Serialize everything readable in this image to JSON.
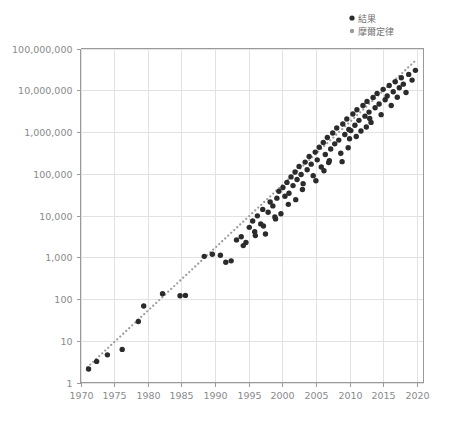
{
  "chart_data": {
    "type": "scatter",
    "title": "",
    "subtitle": "",
    "xlabel": "",
    "ylabel": "",
    "xlim": [
      1970,
      2021
    ],
    "ylim": [
      1,
      100000000
    ],
    "yscale": "log",
    "xscale": "linear",
    "grid": true,
    "legend_position": "top-right",
    "x_ticks": [
      1970,
      1975,
      1980,
      1985,
      1990,
      1995,
      2000,
      2005,
      2010,
      2015,
      2020
    ],
    "x_tick_labels": [
      "1970",
      "1975",
      "1980",
      "1985",
      "1990",
      "1995",
      "2000",
      "2005",
      "2010",
      "2015",
      "2020"
    ],
    "y_ticks": [
      1,
      10,
      100,
      1000,
      10000,
      100000,
      1000000,
      10000000,
      100000000
    ],
    "y_tick_labels": [
      "1",
      "10",
      "100",
      "1,000",
      "10,000",
      "100,000",
      "1,000,000",
      "10,000,000",
      "100,000,000"
    ],
    "colors": {
      "results": "#2b2b2b",
      "moore": "#9b9b9b",
      "grid": "#e2e2e2",
      "axis": "#9a9a9a",
      "tick_text": "#8a8a8a",
      "legend_text": "#6f6f6f",
      "background": "#ffffff"
    },
    "series": [
      {
        "name": "結果",
        "marker": "circle",
        "color": "#2b2b2b",
        "points": [
          [
            1971.2,
            2.1
          ],
          [
            1972.4,
            3.2
          ],
          [
            1974.0,
            4.6
          ],
          [
            1976.2,
            6.2
          ],
          [
            1978.6,
            29.0
          ],
          [
            1979.4,
            68.0
          ],
          [
            1982.2,
            134.0
          ],
          [
            1984.8,
            120.0
          ],
          [
            1985.6,
            122.0
          ],
          [
            1988.4,
            1050.0
          ],
          [
            1989.6,
            1180.0
          ],
          [
            1990.8,
            1120.0
          ],
          [
            1991.6,
            760.0
          ],
          [
            1992.4,
            820.0
          ],
          [
            1993.2,
            2600.0
          ],
          [
            1993.9,
            3100.0
          ],
          [
            1994.6,
            2250.0
          ],
          [
            1995.1,
            5200.0
          ],
          [
            1995.6,
            7400.0
          ],
          [
            1995.9,
            4100.0
          ],
          [
            1996.3,
            9800.0
          ],
          [
            1996.8,
            6300.0
          ],
          [
            1997.1,
            14000.0
          ],
          [
            1997.5,
            3600.0
          ],
          [
            1997.9,
            12000.0
          ],
          [
            1998.2,
            21000.0
          ],
          [
            1998.6,
            17000.0
          ],
          [
            1998.9,
            9200.0
          ],
          [
            1999.2,
            26000.0
          ],
          [
            1999.5,
            38000.0
          ],
          [
            1999.8,
            11000.0
          ],
          [
            2000.1,
            47000.0
          ],
          [
            2000.4,
            29000.0
          ],
          [
            2000.7,
            62000.0
          ],
          [
            2001.0,
            34000.0
          ],
          [
            2001.3,
            84000.0
          ],
          [
            2001.6,
            52000.0
          ],
          [
            2001.9,
            110000.0
          ],
          [
            2002.2,
            73000.0
          ],
          [
            2002.5,
            150000.0
          ],
          [
            2002.8,
            96000.0
          ],
          [
            2003.1,
            58000.0
          ],
          [
            2003.4,
            190000.0
          ],
          [
            2003.7,
            125000.0
          ],
          [
            2004.0,
            260000.0
          ],
          [
            2004.3,
            170000.0
          ],
          [
            2004.6,
            90000.0
          ],
          [
            2004.9,
            330000.0
          ],
          [
            2005.2,
            215000.0
          ],
          [
            2005.5,
            430000.0
          ],
          [
            2005.8,
            145000.0
          ],
          [
            2006.1,
            560000.0
          ],
          [
            2006.4,
            290000.0
          ],
          [
            2006.7,
            740000.0
          ],
          [
            2006.9,
            185000.0
          ],
          [
            2007.2,
            390000.0
          ],
          [
            2007.5,
            950000.0
          ],
          [
            2007.8,
            520000.0
          ],
          [
            2008.1,
            1250000.0
          ],
          [
            2008.4,
            640000.0
          ],
          [
            2008.7,
            310000.0
          ],
          [
            2009.0,
            1550000.0
          ],
          [
            2009.3,
            870000.0
          ],
          [
            2009.6,
            2050000.0
          ],
          [
            2009.9,
            1150000.0
          ],
          [
            2010.2,
            1080000.0
          ],
          [
            2010.5,
            2700000.0
          ],
          [
            2010.8,
            1450000.0
          ],
          [
            2011.1,
            3400000.0
          ],
          [
            2011.4,
            1900000.0
          ],
          [
            2011.7,
            1060000.0
          ],
          [
            2012.0,
            4300000.0
          ],
          [
            2012.3,
            2400000.0
          ],
          [
            2012.6,
            5400000.0
          ],
          [
            2012.9,
            3000000.0
          ],
          [
            2013.2,
            1700000.0
          ],
          [
            2013.5,
            6700000.0
          ],
          [
            2013.8,
            3800000.0
          ],
          [
            2014.1,
            8400000.0
          ],
          [
            2014.4,
            4700000.0
          ],
          [
            2014.7,
            2600000.0
          ],
          [
            2015.0,
            10500000.0
          ],
          [
            2015.3,
            5900000.0
          ],
          [
            2015.6,
            7300000.0
          ],
          [
            2015.9,
            13000000.0
          ],
          [
            2016.2,
            4300000.0
          ],
          [
            2016.5,
            9200000.0
          ],
          [
            2016.8,
            16000000.0
          ],
          [
            2017.1,
            6800000.0
          ],
          [
            2017.4,
            11500000.0
          ],
          [
            2017.7,
            20000000.0
          ],
          [
            2018.0,
            14000000.0
          ],
          [
            2018.4,
            8800000.0
          ],
          [
            2018.8,
            24000000.0
          ],
          [
            2019.3,
            17500000.0
          ],
          [
            2019.8,
            30000000.0
          ],
          [
            2008.9,
            195000.0
          ],
          [
            2006.2,
            118000.0
          ],
          [
            2007.0,
            205000.0
          ],
          [
            2009.8,
            420000.0
          ],
          [
            2005.0,
            68000.0
          ],
          [
            2003.0,
            42000.0
          ],
          [
            2002.0,
            24000.0
          ],
          [
            2000.9,
            18500.0
          ],
          [
            1999.0,
            8300.0
          ],
          [
            1997.2,
            5600.0
          ],
          [
            1996.0,
            3300.0
          ],
          [
            1994.2,
            1900.0
          ],
          [
            2010.0,
            690000.0
          ],
          [
            2011.0,
            780000.0
          ],
          [
            2012.5,
            1320000.0
          ],
          [
            2013.0,
            2100000.0
          ]
        ]
      },
      {
        "name": "摩爾定律",
        "marker": "dotted-line",
        "color": "#9b9b9b",
        "description": "Doubling every 2 years reference trend",
        "anchor_year": 1971,
        "anchor_value": 2.3,
        "doubling_period_years": 2.0,
        "end_year": 2020,
        "end_value": 40000000
      }
    ]
  },
  "legend": {
    "items": [
      {
        "label": "結果",
        "marker": "filled-circle",
        "color": "#2b2b2b"
      },
      {
        "label": "摩爾定律",
        "marker": "filled-circle",
        "color": "#9b9b9b"
      }
    ]
  }
}
